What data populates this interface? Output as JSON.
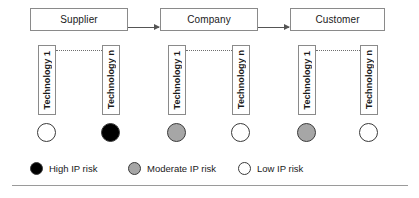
{
  "diagram": {
    "actors": [
      {
        "label": "Supplier"
      },
      {
        "label": "Company"
      },
      {
        "label": "Customer"
      }
    ],
    "arrows": [
      {
        "from": "Supplier",
        "to": "Company"
      },
      {
        "from": "Company",
        "to": "Customer"
      }
    ],
    "groups": [
      {
        "actor": "Supplier",
        "technologies": [
          {
            "label": "Technology 1",
            "risk": "Low IP risk",
            "color": "#ffffff"
          },
          {
            "label": "Technology n",
            "risk": "High IP risk",
            "color": "#000000"
          }
        ]
      },
      {
        "actor": "Company",
        "technologies": [
          {
            "label": "Technology 1",
            "risk": "Moderate IP risk",
            "color": "#a6a6a6"
          },
          {
            "label": "Technology n",
            "risk": "Low IP risk",
            "color": "#ffffff"
          }
        ]
      },
      {
        "actor": "Customer",
        "technologies": [
          {
            "label": "Technology 1",
            "risk": "Moderate IP risk",
            "color": "#a6a6a6"
          },
          {
            "label": "Technology n",
            "risk": "Low IP risk",
            "color": "#ffffff"
          }
        ]
      }
    ],
    "legend": [
      {
        "label": "High IP risk",
        "color": "#000000"
      },
      {
        "label": "Moderate IP risk",
        "color": "#a6a6a6"
      },
      {
        "label": "Low IP risk",
        "color": "#ffffff"
      }
    ]
  }
}
